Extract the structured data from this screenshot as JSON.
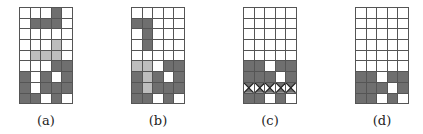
{
  "figure": {
    "colors": {
      "dark": "#6f6f6f",
      "light": "#bdbdbd",
      "empty": "#ffffff",
      "grid_line": "#555555"
    },
    "legend": {
      "d": "dark filled cell",
      "l": "light gray (falling piece)",
      ".": "empty cell",
      "x": "cleared row (crossed)"
    },
    "panels": [
      {
        "label": "(a)",
        "rows": [
          "...d.",
          ".ddd.",
          ".....",
          "...l.",
          ".lll.",
          "...dd",
          "d.d.d",
          "d.ddd",
          "dd.d."
        ]
      },
      {
        "label": "(b)",
        "rows": [
          ".....",
          "dd...",
          ".d...",
          ".d...",
          ".....",
          "ll.dd",
          "dld.d",
          "dlddd",
          "dd.d."
        ]
      },
      {
        "label": "(c)",
        "rows": [
          ".....",
          ".....",
          ".....",
          ".....",
          ".....",
          "dd.dd",
          "ddd.d",
          "xxxxx",
          "dd.d."
        ]
      },
      {
        "label": "(d)",
        "rows": [
          ".....",
          ".....",
          ".....",
          ".....",
          ".....",
          ".....",
          "dd.dd",
          "ddd.d",
          "dd.d."
        ]
      }
    ]
  }
}
